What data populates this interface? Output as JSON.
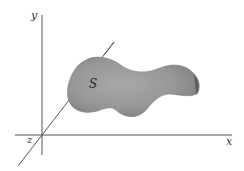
{
  "diagram": {
    "axes": {
      "x_label": "x",
      "y_label": "y",
      "z_label": "z"
    },
    "surface": {
      "label": "S",
      "fill": "#9a9a9a"
    },
    "colors": {
      "axis": "#555555",
      "label": "#333333",
      "background": "#ffffff"
    }
  }
}
